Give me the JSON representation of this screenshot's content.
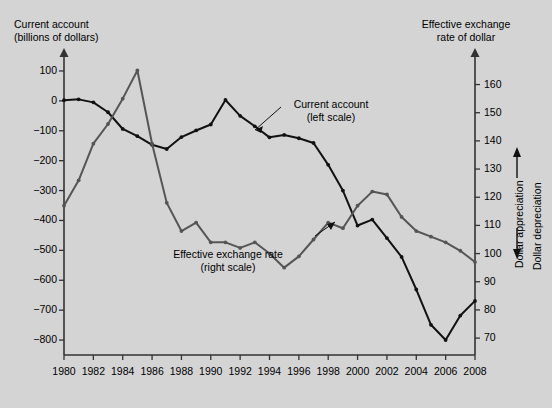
{
  "figure": {
    "background_color": "#d4d4d4",
    "left_axis_title": "Current account\n(billions of dollars)",
    "right_axis_title": "Effective exchange\nrate of dollar",
    "annotation_current_account": "Current account\n(left scale)",
    "annotation_exchange_rate": "Effective exchange rate\n(right scale)",
    "vertical_label_appreciation": "Dollar appreciation",
    "vertical_label_depreciation": "Dollar depreciation",
    "series_color_current_account": "#111111",
    "series_color_exchange_rate": "#555555"
  },
  "chart_data": {
    "type": "line",
    "title": "",
    "xlabel": "",
    "ylabel": "Current account (billions of dollars)",
    "y2label": "Effective exchange rate of dollar",
    "grid": false,
    "legend": "inline annotations",
    "x": [
      1980,
      1981,
      1982,
      1983,
      1984,
      1985,
      1986,
      1987,
      1988,
      1989,
      1990,
      1991,
      1992,
      1993,
      1994,
      1995,
      1996,
      1997,
      1998,
      1999,
      2000,
      2001,
      2002,
      2003,
      2004,
      2005,
      2006,
      2007,
      2008
    ],
    "xticklabels": [
      "1980",
      "1982",
      "1984",
      "1986",
      "1988",
      "1990",
      "1992",
      "1994",
      "1996",
      "1998",
      "2000",
      "2002",
      "2004",
      "2006",
      "2008"
    ],
    "xlim": [
      1980,
      2008
    ],
    "ylim": [
      -850,
      130
    ],
    "yticks": [
      100,
      0,
      -100,
      -200,
      -300,
      -400,
      -500,
      -600,
      -700,
      -800
    ],
    "yticklabels": [
      "100",
      "0",
      "−100",
      "−200",
      "−300",
      "−400",
      "−500",
      "−600",
      "−700",
      "−800"
    ],
    "y2lim": [
      64,
      168
    ],
    "y2ticks": [
      160,
      150,
      140,
      130,
      120,
      110,
      100,
      90,
      80,
      70
    ],
    "y2ticklabels": [
      "160",
      "150",
      "140",
      "130",
      "120",
      "110",
      "100",
      "90",
      "80",
      "70"
    ],
    "series": [
      {
        "name": "Current account (left scale)",
        "axis": "left",
        "color": "#111111",
        "values": [
          2,
          5,
          -5,
          -38,
          -94,
          -118,
          -147,
          -161,
          -121,
          -99,
          -79,
          3,
          -50,
          -85,
          -122,
          -114,
          -125,
          -141,
          -214,
          -300,
          -417,
          -397,
          -459,
          -522,
          -631,
          -749,
          -800,
          -718,
          -669
        ]
      },
      {
        "name": "Effective exchange rate (right scale)",
        "axis": "right",
        "color": "#555555",
        "values": [
          117,
          126,
          139,
          146,
          155,
          165,
          139,
          118,
          108,
          111,
          104,
          104,
          102,
          104,
          100,
          95,
          99,
          105,
          111,
          109,
          117,
          122,
          121,
          113,
          108,
          106,
          104,
          101,
          97
        ]
      }
    ]
  }
}
